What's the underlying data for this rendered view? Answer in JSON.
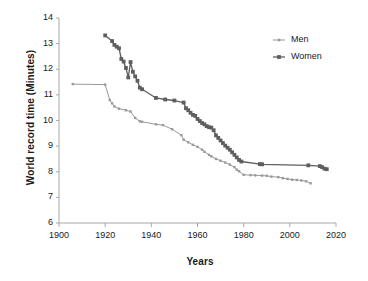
{
  "chart_data": {
    "type": "line",
    "title": "",
    "xlabel": "Years",
    "ylabel": "World record time (Minutes)",
    "xlim": [
      1900,
      2020
    ],
    "ylim": [
      6,
      14
    ],
    "xticks": [
      1900,
      1920,
      1940,
      1960,
      1980,
      2000,
      2020
    ],
    "yticks": [
      6,
      7,
      8,
      9,
      10,
      11,
      12,
      13,
      14
    ],
    "grid": false,
    "legend_position": "top-right",
    "colors": {
      "men": "#9a9a9a",
      "women": "#5e5e5e",
      "axis": "#a8a8a8",
      "text": "#1a1a1a"
    },
    "series": [
      {
        "name": "Men",
        "color": "#9a9a9a",
        "marker": "square-small",
        "points": [
          [
            1906,
            11.42
          ],
          [
            1920,
            11.4
          ],
          [
            1922,
            10.8
          ],
          [
            1923,
            10.67
          ],
          [
            1924,
            10.55
          ],
          [
            1926,
            10.46
          ],
          [
            1929,
            10.4
          ],
          [
            1931,
            10.35
          ],
          [
            1933,
            10.1
          ],
          [
            1935,
            9.97
          ],
          [
            1936,
            9.95
          ],
          [
            1942,
            9.85
          ],
          [
            1945,
            9.82
          ],
          [
            1949,
            9.66
          ],
          [
            1953,
            9.43
          ],
          [
            1954,
            9.25
          ],
          [
            1956,
            9.15
          ],
          [
            1958,
            9.05
          ],
          [
            1960,
            8.97
          ],
          [
            1962,
            8.86
          ],
          [
            1963,
            8.78
          ],
          [
            1965,
            8.66
          ],
          [
            1966,
            8.6
          ],
          [
            1968,
            8.5
          ],
          [
            1970,
            8.43
          ],
          [
            1972,
            8.36
          ],
          [
            1974,
            8.28
          ],
          [
            1976,
            8.18
          ],
          [
            1977,
            8.08
          ],
          [
            1978,
            8.02
          ],
          [
            1980,
            7.88
          ],
          [
            1983,
            7.87
          ],
          [
            1985,
            7.86
          ],
          [
            1988,
            7.85
          ],
          [
            1990,
            7.84
          ],
          [
            1992,
            7.81
          ],
          [
            1995,
            7.79
          ],
          [
            1997,
            7.75
          ],
          [
            1999,
            7.72
          ],
          [
            2001,
            7.69
          ],
          [
            2003,
            7.68
          ],
          [
            2005,
            7.66
          ],
          [
            2007,
            7.63
          ],
          [
            2009,
            7.55
          ]
        ]
      },
      {
        "name": "Women",
        "color": "#5e5e5e",
        "marker": "square",
        "points": [
          [
            1920,
            13.32
          ],
          [
            1923,
            13.1
          ],
          [
            1924,
            12.95
          ],
          [
            1925,
            12.88
          ],
          [
            1926,
            12.82
          ],
          [
            1927,
            12.4
          ],
          [
            1928,
            12.3
          ],
          [
            1929,
            12.05
          ],
          [
            1930,
            11.68
          ],
          [
            1931,
            12.28
          ],
          [
            1932,
            11.9
          ],
          [
            1933,
            11.72
          ],
          [
            1934,
            11.55
          ],
          [
            1935,
            11.28
          ],
          [
            1936,
            11.22
          ],
          [
            1942,
            10.88
          ],
          [
            1946,
            10.82
          ],
          [
            1950,
            10.78
          ],
          [
            1954,
            10.7
          ],
          [
            1955,
            10.48
          ],
          [
            1956,
            10.4
          ],
          [
            1957,
            10.3
          ],
          [
            1958,
            10.22
          ],
          [
            1959,
            10.18
          ],
          [
            1960,
            10.06
          ],
          [
            1961,
            9.98
          ],
          [
            1962,
            9.9
          ],
          [
            1963,
            9.85
          ],
          [
            1964,
            9.78
          ],
          [
            1965,
            9.74
          ],
          [
            1966,
            9.72
          ],
          [
            1967,
            9.62
          ],
          [
            1968,
            9.42
          ],
          [
            1969,
            9.32
          ],
          [
            1970,
            9.22
          ],
          [
            1971,
            9.12
          ],
          [
            1972,
            9.02
          ],
          [
            1973,
            8.94
          ],
          [
            1974,
            8.86
          ],
          [
            1975,
            8.76
          ],
          [
            1976,
            8.66
          ],
          [
            1977,
            8.56
          ],
          [
            1978,
            8.46
          ],
          [
            1979,
            8.4
          ],
          [
            1987,
            8.3
          ],
          [
            1988,
            8.29
          ],
          [
            2008,
            8.25
          ],
          [
            2013,
            8.22
          ],
          [
            2014,
            8.18
          ],
          [
            2015,
            8.12
          ],
          [
            2016,
            8.1
          ]
        ]
      }
    ]
  },
  "legend": {
    "items": [
      {
        "label": "Men",
        "color": "#9a9a9a"
      },
      {
        "label": "Women",
        "color": "#5e5e5e"
      }
    ]
  },
  "axes": {
    "y_title": "World record time (Minutes)",
    "x_title": "Years",
    "y_tick_labels": [
      "14",
      "13",
      "12",
      "11",
      "10",
      "9",
      "8",
      "7",
      "6"
    ],
    "x_tick_labels": [
      "1900",
      "1920",
      "1940",
      "1960",
      "1980",
      "2000",
      "2020"
    ]
  }
}
